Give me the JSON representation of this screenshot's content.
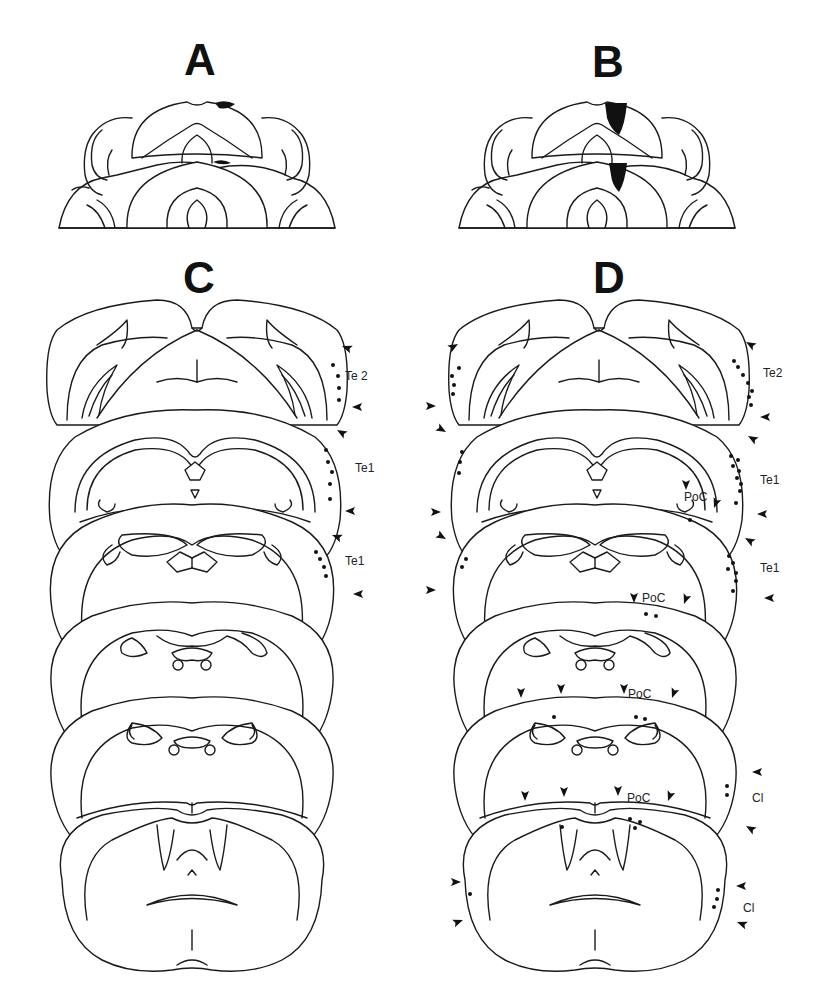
{
  "figure": {
    "panels": [
      {
        "id": "A",
        "label": "A",
        "type": "horizontal-lesion-section",
        "lesion": "small superficial lesion, dorsal midline-right"
      },
      {
        "id": "B",
        "label": "B",
        "type": "horizontal-lesion-section",
        "lesion": "deep wedge-shaped lesion, dorsal midline-right"
      },
      {
        "id": "C",
        "label": "C",
        "type": "coronal-series",
        "sections": 6,
        "annotations": [
          {
            "text": "Te 2"
          },
          {
            "text": "Te1"
          },
          {
            "text": "Te1"
          }
        ]
      },
      {
        "id": "D",
        "label": "D",
        "type": "coronal-series",
        "sections": 6,
        "annotations": [
          {
            "text": "Te2"
          },
          {
            "text": "Te1"
          },
          {
            "text": "PoC"
          },
          {
            "text": "Te1"
          },
          {
            "text": "PoC"
          },
          {
            "text": "PoC"
          },
          {
            "text": "Cl"
          },
          {
            "text": "PoC"
          },
          {
            "text": "Cl"
          }
        ]
      }
    ],
    "labels": {
      "A": "A",
      "B": "B",
      "C": "C",
      "D": "D",
      "c_te2": "Te 2",
      "c_te1a": "Te1",
      "c_te1b": "Te1",
      "d_te2": "Te2",
      "d_te1a": "Te1",
      "d_poc1": "PoC",
      "d_te1b": "Te1",
      "d_poc2": "PoC",
      "d_poc3": "PoC",
      "d_cl1": "Cl",
      "d_poc4": "PoC",
      "d_cl2": "Cl"
    },
    "colors": {
      "line": "#1a1a1a",
      "fill": "#111111",
      "background": "#ffffff"
    }
  }
}
